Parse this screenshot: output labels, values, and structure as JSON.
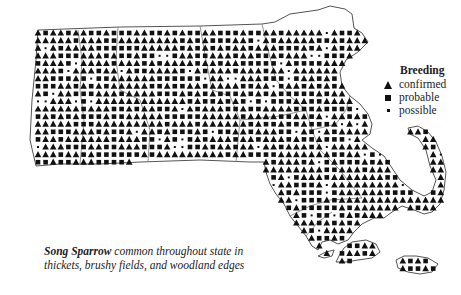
{
  "map": {
    "title": "Song Sparrow breeding distribution",
    "region": "Massachusetts",
    "marker_color": "#111111",
    "outline_color": "#555555"
  },
  "legend": {
    "title": "Breeding",
    "items": [
      {
        "symbol": "triangle",
        "label": "confirmed"
      },
      {
        "symbol": "square",
        "label": "probable"
      },
      {
        "symbol": "dot",
        "label": "possible"
      }
    ]
  },
  "caption": {
    "species": "Song Sparrow",
    "line1_rest": " common throughout state in",
    "line2": "thickets, brushy fields, and woodland edges"
  }
}
